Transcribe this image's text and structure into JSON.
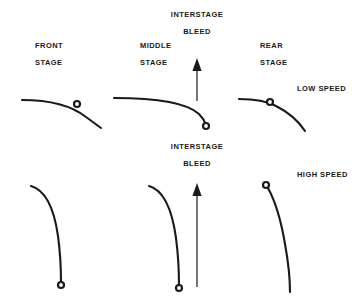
{
  "diagram": {
    "width": 356,
    "height": 305,
    "background": "#ffffff",
    "ink": "#1a1a1a"
  },
  "labels": {
    "interstage_bleed_top_line1": "INTERSTAGE",
    "interstage_bleed_top_line2": "BLEED",
    "interstage_bleed_bottom_line1": "INTERSTAGE",
    "interstage_bleed_bottom_line2": "BLEED",
    "front_stage_line1": "FRONT",
    "front_stage_line2": "STAGE",
    "middle_stage_line1": "MIDDLE",
    "middle_stage_line2": "STAGE",
    "rear_stage_line1": "REAR",
    "rear_stage_line2": "STAGE",
    "low_speed": "LOW SPEED",
    "high_speed": "HIGH SPEED"
  },
  "rows": [
    {
      "name": "low-speed",
      "speed_label": "LOW SPEED",
      "stages": [
        "FRONT STAGE",
        "MIDDLE STAGE",
        "REAR STAGE"
      ]
    },
    {
      "name": "high-speed",
      "speed_label": "HIGH SPEED",
      "stages": [
        "FRONT STAGE",
        "MIDDLE STAGE",
        "REAR STAGE"
      ]
    }
  ],
  "arrows": [
    {
      "name": "interstage-bleed-arrow-top",
      "direction": "up",
      "x": 197,
      "y_tail": 101,
      "y_tip": 58
    },
    {
      "name": "interstage-bleed-arrow-bottom",
      "direction": "up",
      "x": 197,
      "y_tail": 287,
      "y_tip": 183
    }
  ],
  "markers": [
    {
      "name": "front-stage-low-speed-marker",
      "cx": 77,
      "cy": 104
    },
    {
      "name": "middle-stage-low-speed-marker",
      "cx": 206,
      "cy": 126
    },
    {
      "name": "rear-stage-low-speed-marker",
      "cx": 270,
      "cy": 102
    },
    {
      "name": "front-stage-high-speed-marker",
      "cx": 61,
      "cy": 285
    },
    {
      "name": "middle-stage-high-speed-marker",
      "cx": 179,
      "cy": 288
    },
    {
      "name": "rear-stage-high-speed-marker",
      "cx": 266,
      "cy": 185
    }
  ],
  "curves": [
    {
      "name": "front-stage-low-speed-curve",
      "path": "M 22,100 C 52,100 72,106 86,117 L 101,128",
      "stroke_width": 2.1
    },
    {
      "name": "middle-stage-low-speed-curve",
      "path": "M 114,98 C 152,98 186,102 199,114 C 203,118 205,122 206,125",
      "stroke_width": 2.1
    },
    {
      "name": "rear-stage-low-speed-curve",
      "path": "M 239,99 C 252,99 265,100 276,106 C 290,113 299,122 305,131",
      "stroke_width": 2.1
    },
    {
      "name": "front-stage-high-speed-curve",
      "path": "M 31,186 C 45,190 54,208 58,236 C 61,258 61,274 61,283",
      "stroke_width": 2.1
    },
    {
      "name": "middle-stage-high-speed-curve",
      "path": "M 149,186 C 163,190 172,209 176,238 C 179,261 179,278 179,286",
      "stroke_width": 2.1
    },
    {
      "name": "rear-stage-high-speed-curve",
      "path": "M 268,188 C 274,199 281,220 285,244 C 289,266 290,282 290,292",
      "stroke_width": 2.1
    }
  ]
}
